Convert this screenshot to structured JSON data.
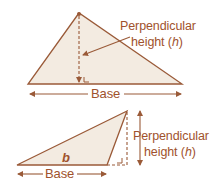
{
  "colors": {
    "stroke": "#9a5a38",
    "fill": "#f3ebe1",
    "text": "#a0522d",
    "background": "#ffffff"
  },
  "figure_top": {
    "name": "acute-triangle",
    "height_label_line1": "Perpendicular",
    "height_label_line2_prefix": "height (",
    "height_label_var": "h",
    "height_label_line2_suffix": ")",
    "base_label": "Base",
    "right_angle_marker": "∟"
  },
  "figure_bottom": {
    "name": "obtuse-triangle",
    "side_label": "b",
    "height_label_line1": "Perpendicular",
    "height_label_line2_prefix": "height (",
    "height_label_var": "h",
    "height_label_line2_suffix": ")",
    "base_label": "Base"
  }
}
